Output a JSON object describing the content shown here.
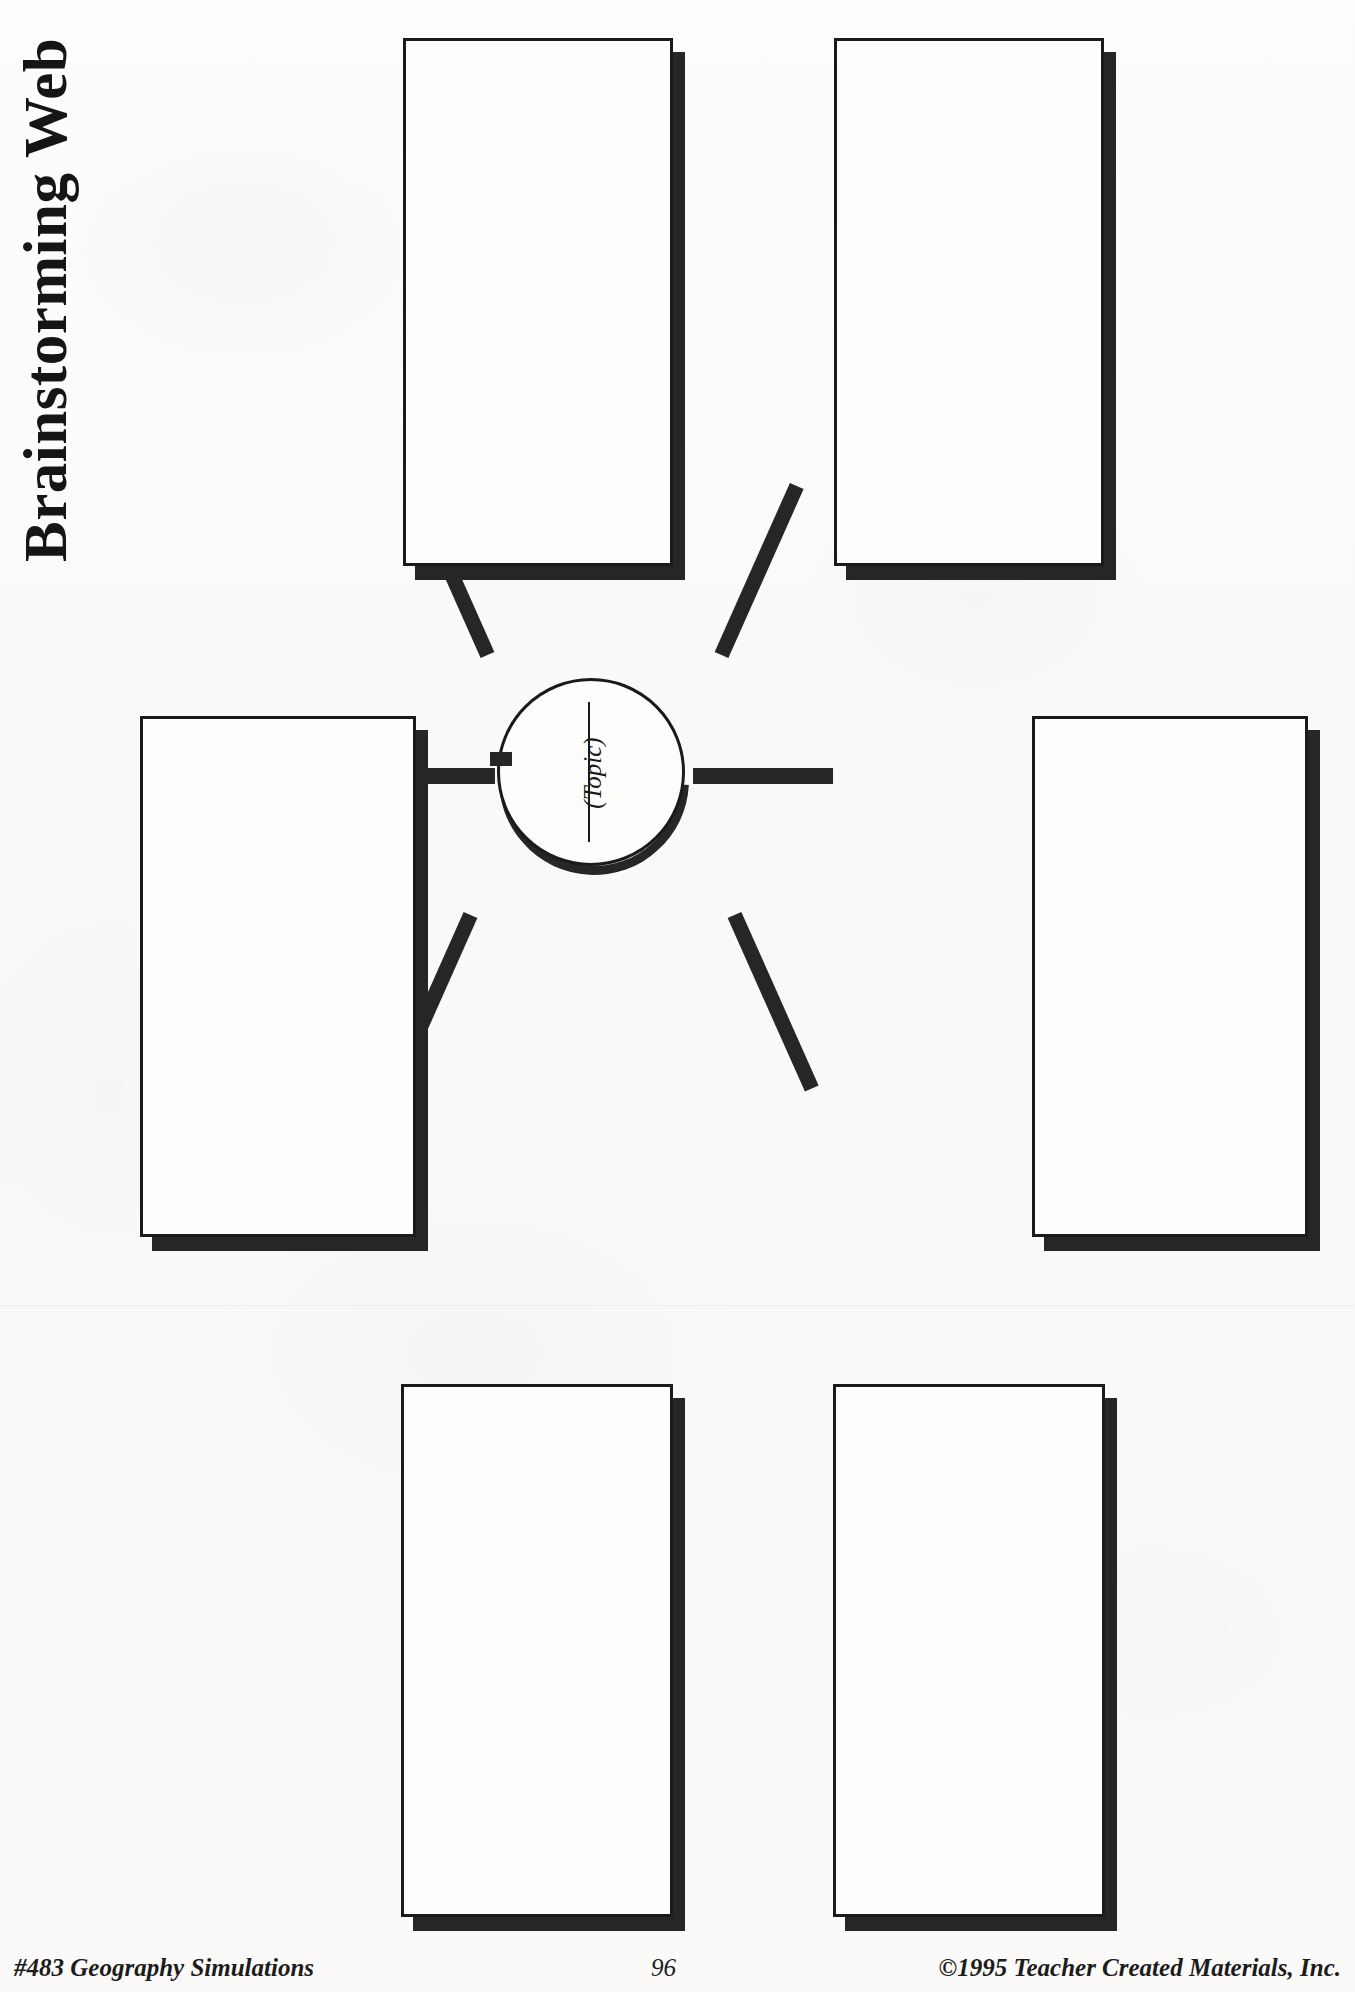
{
  "page": {
    "title": "Brainstorming Web",
    "orientation": "landscape-rotated",
    "background_color": "#fbfbf9",
    "ink_color": "#1a1a1a"
  },
  "center": {
    "shape": "circle",
    "label": "(Topic)",
    "has_write_on_rule": true
  },
  "boxes": [
    {
      "id": "box-top-left",
      "label": ""
    },
    {
      "id": "box-top-right",
      "label": ""
    },
    {
      "id": "box-mid-left",
      "label": ""
    },
    {
      "id": "box-mid-right",
      "label": ""
    },
    {
      "id": "box-bottom-left",
      "label": ""
    },
    {
      "id": "box-bottom-right",
      "label": ""
    }
  ],
  "connectors": [
    {
      "id": "spoke-top-left",
      "from": "center",
      "to": "box-top-left"
    },
    {
      "id": "spoke-top-right",
      "from": "center",
      "to": "box-top-right"
    },
    {
      "id": "spoke-mid-left",
      "from": "center",
      "to": "box-mid-left"
    },
    {
      "id": "spoke-mid-right",
      "from": "center",
      "to": "box-mid-right"
    },
    {
      "id": "spoke-bottom-left",
      "from": "center",
      "to": "box-bottom-left"
    },
    {
      "id": "spoke-bottom-right",
      "from": "center",
      "to": "box-bottom-right"
    }
  ],
  "footer": {
    "left": "#483 Geography Simulations",
    "page_number": "96",
    "right": "©1995 Teacher Created Materials, Inc."
  }
}
